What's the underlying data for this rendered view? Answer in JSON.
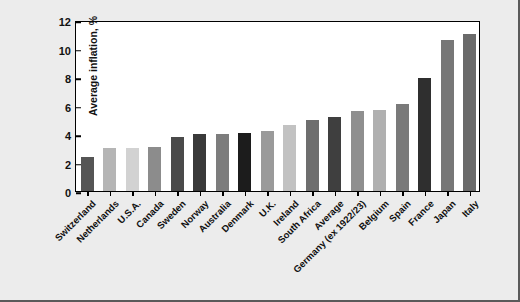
{
  "chart_data": {
    "type": "bar",
    "title": "",
    "xlabel": "",
    "ylabel": "Average inflation, %",
    "ylim": [
      0,
      12
    ],
    "yticks": [
      0,
      2,
      4,
      6,
      8,
      10,
      12
    ],
    "grid": false,
    "legend": "none",
    "categories": [
      "Switzerland",
      "Netherlands",
      "U.S.A.",
      "Canada",
      "Sweden",
      "Norway",
      "Australia",
      "Denmark",
      "U.K.",
      "Ireland",
      "South Africa",
      "Average",
      "Germany (ex 1922/23)",
      "Belgium",
      "Spain",
      "France",
      "Japan",
      "Italy"
    ],
    "values": [
      2.4,
      3.0,
      3.0,
      3.1,
      3.8,
      4.0,
      4.0,
      4.1,
      4.2,
      4.6,
      5.0,
      5.2,
      5.6,
      5.7,
      6.1,
      7.9,
      10.6,
      11.0
    ],
    "bar_colors": [
      "#555555",
      "#b5b5b5",
      "#d2d2d2",
      "#8c8c8c",
      "#4a4a4a",
      "#3a3a3a",
      "#7d7d7d",
      "#1c1c1c",
      "#9a9a9a",
      "#c2c2c2",
      "#6e6e6e",
      "#3f3f3f",
      "#8f8f8f",
      "#b0b0b0",
      "#7a7a7a",
      "#2f2f2f",
      "#777777",
      "#6a6a6a",
      "#c6c6c6"
    ],
    "background": "#ececec",
    "plot_background": "#ffffff",
    "axis_color": "#000000"
  }
}
